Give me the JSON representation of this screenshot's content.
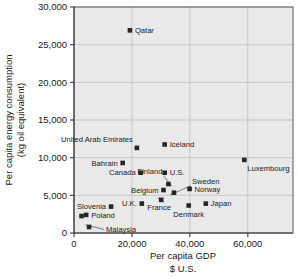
{
  "chart_data": {
    "type": "scatter",
    "title": "",
    "xlabel": "Per capita GDP",
    "xlabel_sub": "$ U.S.",
    "ylabel_line1": "Per capita energy consumption",
    "ylabel_line2": "(kg oil equivalent)",
    "xlim": [
      0,
      75600
    ],
    "ylim": [
      0,
      30000
    ],
    "xticks": [
      0,
      20000,
      40000,
      60000
    ],
    "xtick_labels": [
      "0",
      "20,000",
      "40,000",
      "60,000"
    ],
    "yticks": [
      0,
      5000,
      10000,
      15000,
      20000,
      25000,
      30000
    ],
    "ytick_labels": [
      "0",
      "5,000",
      "10,000",
      "15,000",
      "20,000",
      "25,000",
      "30,000"
    ],
    "grid": "horizontal-and-vertical",
    "legend": "none",
    "points": [
      {
        "name": "Qatar",
        "x": 19300,
        "y": 26900,
        "label_side": "right",
        "leader": false
      },
      {
        "name": "United Arab Emirates",
        "x": 21700,
        "y": 11300,
        "label_side": "above-left",
        "leader": false
      },
      {
        "name": "Iceland",
        "x": 31300,
        "y": 11750,
        "label_side": "right",
        "leader": false
      },
      {
        "name": "Luxembourg",
        "x": 58800,
        "y": 9700,
        "label_side": "below-right",
        "leader": false
      },
      {
        "name": "Bahrain",
        "x": 16800,
        "y": 9300,
        "label_side": "left",
        "leader": false
      },
      {
        "name": "Canada",
        "x": 23000,
        "y": 8000,
        "label_side": "left",
        "leader": false
      },
      {
        "name": "U.S.",
        "x": 31300,
        "y": 8000,
        "label_side": "right",
        "leader": false
      },
      {
        "name": "Finland",
        "x": 32600,
        "y": 6500,
        "label_side": "above-left",
        "leader": true
      },
      {
        "name": "Sweden",
        "x": 34500,
        "y": 5350,
        "label_side": "above-right",
        "leader": true
      },
      {
        "name": "Belgium",
        "x": 30900,
        "y": 5700,
        "label_side": "left",
        "leader": false
      },
      {
        "name": "Norway",
        "x": 39900,
        "y": 5850,
        "label_side": "right",
        "leader": false
      },
      {
        "name": "U.K.",
        "x": 23400,
        "y": 3900,
        "label_side": "left",
        "leader": false
      },
      {
        "name": "France",
        "x": 30100,
        "y": 4400,
        "label_side": "below-left",
        "leader": true
      },
      {
        "name": "Denmark",
        "x": 39600,
        "y": 3650,
        "label_side": "below",
        "leader": false
      },
      {
        "name": "Japan",
        "x": 45500,
        "y": 3900,
        "label_side": "right",
        "leader": false
      },
      {
        "name": "Slovenia",
        "x": 12800,
        "y": 3500,
        "label_side": "left",
        "leader": false
      },
      {
        "name": "Poland",
        "x": 4200,
        "y": 2400,
        "label_side": "right",
        "leader": false
      },
      {
        "name": "Poland2",
        "x": 2600,
        "y": 2250,
        "label_side": "none",
        "leader": false
      },
      {
        "name": "Malaysia",
        "x": 5200,
        "y": 800,
        "label_side": "right",
        "leader": true
      }
    ]
  },
  "labels": {
    "Qatar": "Qatar",
    "United Arab Emirates": "United Arab Emirates",
    "Iceland": "Iceland",
    "Luxembourg": "Luxembourg",
    "Bahrain": "Bahrain",
    "Canada": "Canada",
    "U.S.": "U.S.",
    "Finland": "Finland",
    "Sweden": "Sweden",
    "Belgium": "Belgium",
    "Norway": "Norway",
    "U.K.": "U.K.",
    "France": "France",
    "Denmark": "Denmark",
    "Japan": "Japan",
    "Slovenia": "Slovenia",
    "Poland": "Poland",
    "Malaysia": "Malaysia"
  },
  "colors": {
    "marker": "#262626",
    "plot_bg": "#e9e9e9",
    "grid": "#b8b8b8",
    "frame": "#5a5a5a",
    "text": "#1a1a1a"
  }
}
